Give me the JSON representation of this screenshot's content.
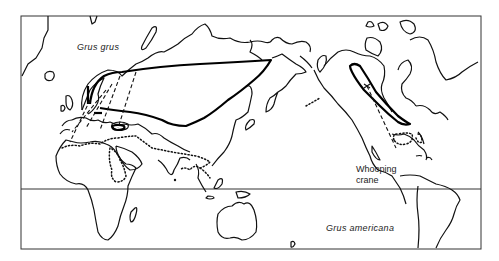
{
  "map": {
    "type": "distribution-map",
    "projection": "world, Pacific-centered (Old World left, Americas right)",
    "labels": {
      "grus_grus": "Grus grus",
      "whooping_line1": "Whooping",
      "whooping_line2": "crane",
      "grus_americana": "Grus americana"
    },
    "legend_semantics": {
      "solid_thick_line": "breeding range",
      "dotted_line": "wintering range",
      "dashed_arrows": "migration routes"
    },
    "colors": {
      "ink": "#111111",
      "background": "#ffffff"
    }
  }
}
